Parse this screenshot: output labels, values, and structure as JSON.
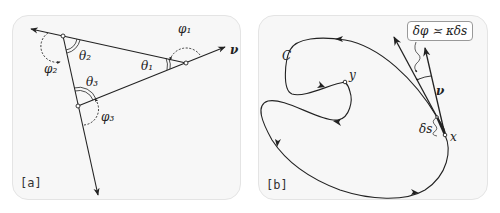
{
  "figure": {
    "panels": [
      {
        "id": "a",
        "tag": "[a]",
        "labels": {
          "phi1": "φ₁",
          "phi2": "φ₂",
          "phi3": "φ₃",
          "theta1": "θ₁",
          "theta2": "θ₂",
          "theta3": "θ₃",
          "v": "ν"
        }
      },
      {
        "id": "b",
        "tag": "[b]",
        "labels": {
          "curve": "C",
          "y": "y",
          "x": "x",
          "v": "ν",
          "ds": "δs",
          "equation": "δφ ≍ κδs"
        }
      }
    ],
    "colors": {
      "line": "#222222",
      "panel_bg": "#f7f7f7",
      "panel_border": "#e4e4e4"
    }
  }
}
